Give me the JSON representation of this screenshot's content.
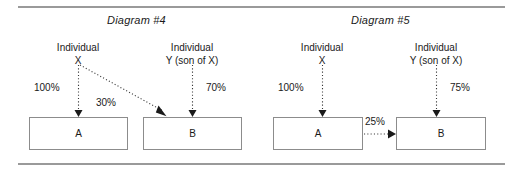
{
  "figure": {
    "frame_color": "#9a9a9a",
    "box_border_color": "#8c8c8c",
    "arrow_color": "#1a1a1a",
    "background": "#ffffff"
  },
  "panels": [
    {
      "id": "diagram-4",
      "title": "Diagram #4",
      "people": [
        {
          "id": "individual-x",
          "line1": "Individual",
          "line2": "X"
        },
        {
          "id": "individual-y",
          "line1": "Individual",
          "line2": "Y (son of X)"
        }
      ],
      "boxes": [
        {
          "id": "box-a",
          "label": "A"
        },
        {
          "id": "box-b",
          "label": "B"
        }
      ],
      "edges": [
        {
          "id": "x-to-a",
          "label": "100%",
          "from": "individual-x",
          "to": "box-a"
        },
        {
          "id": "x-to-b",
          "label": "30%",
          "from": "individual-x",
          "to": "box-b"
        },
        {
          "id": "y-to-b",
          "label": "70%",
          "from": "individual-y",
          "to": "box-b"
        }
      ]
    },
    {
      "id": "diagram-5",
      "title": "Diagram #5",
      "people": [
        {
          "id": "individual-x",
          "line1": "Individual",
          "line2": "X"
        },
        {
          "id": "individual-y",
          "line1": "Individual",
          "line2": "Y (son of X)"
        }
      ],
      "boxes": [
        {
          "id": "box-a",
          "label": "A"
        },
        {
          "id": "box-b",
          "label": "B"
        }
      ],
      "edges": [
        {
          "id": "x-to-a",
          "label": "100%",
          "from": "individual-x",
          "to": "box-a"
        },
        {
          "id": "y-to-b",
          "label": "75%",
          "from": "individual-y",
          "to": "box-b"
        },
        {
          "id": "a-to-b",
          "label": "25%",
          "from": "box-a",
          "to": "box-b"
        }
      ]
    }
  ]
}
